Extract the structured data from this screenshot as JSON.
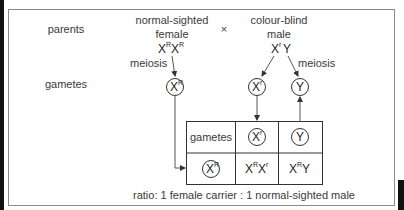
{
  "diagram": {
    "row_labels": {
      "parents": "parents",
      "gametes": "gametes"
    },
    "cross_symbol": "×",
    "female_parent": {
      "description_line1": "normal-sighted",
      "description_line2": "female",
      "genotype": [
        {
          "base": "X",
          "sup": "R"
        },
        {
          "base": "X",
          "sup": "R"
        }
      ],
      "meiosis_label": "meiosis",
      "gametes": [
        {
          "base": "X",
          "sup": "R"
        }
      ]
    },
    "male_parent": {
      "description_line1": "colour-blind",
      "description_line2": "male",
      "genotype": [
        {
          "base": "X",
          "sup": "r"
        },
        {
          "base": "Y",
          "sup": ""
        }
      ],
      "meiosis_label": "meiosis",
      "gametes": [
        {
          "base": "X",
          "sup": "r"
        },
        {
          "base": "Y",
          "sup": ""
        }
      ]
    },
    "punnett": {
      "header_label": "gametes",
      "column_gametes": [
        {
          "base": "X",
          "sup": "r"
        },
        {
          "base": "Y",
          "sup": ""
        }
      ],
      "row_gametes": [
        {
          "base": "X",
          "sup": "R"
        }
      ],
      "offspring": [
        [
          [
            {
              "base": "X",
              "sup": "R"
            },
            {
              "base": "X",
              "sup": "r"
            }
          ],
          [
            {
              "base": "X",
              "sup": "R"
            },
            {
              "base": "Y",
              "sup": ""
            }
          ]
        ]
      ]
    },
    "ratio_text": "ratio: 1 female carrier : 1 normal-sighted male"
  }
}
